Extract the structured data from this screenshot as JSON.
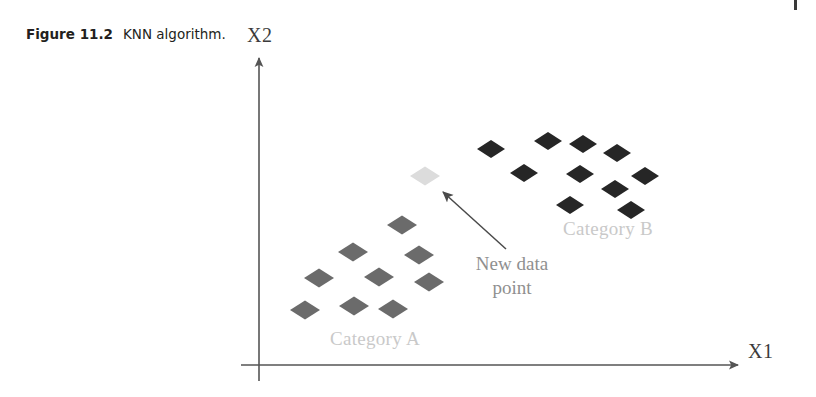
{
  "figure": {
    "caption_label": "Figure 11.2",
    "caption_text": "KNN algorithm."
  },
  "axes": {
    "y_label": "X2",
    "x_label": "X1",
    "axis_color": "#555555",
    "origin": {
      "x": 259,
      "y": 365
    },
    "y_top": 55,
    "x_right": 742,
    "x_left": 241,
    "y_bottom": 381
  },
  "annotations": {
    "category_a_label": "Category A",
    "category_b_label": "Category B",
    "new_point_label": "New data\npoint",
    "category_label_color": "#c9c9c9",
    "new_point_label_color": "#8f8f8f",
    "arrow": {
      "tail": {
        "x": 506,
        "y": 249
      },
      "head": {
        "x": 436,
        "y": 186
      },
      "color": "#4a4a4a"
    }
  },
  "chart_data": {
    "type": "scatter",
    "title": "KNN algorithm",
    "xlabel": "X1",
    "ylabel": "X2",
    "grid": false,
    "legend": "none",
    "marker": "diamond",
    "xlim": [
      259,
      742
    ],
    "ylim": [
      365,
      55
    ],
    "series": [
      {
        "name": "Category A",
        "color": "#6b6b6b",
        "marker_w": 30,
        "marker_h": 19,
        "points": [
          {
            "x": 402,
            "y": 225
          },
          {
            "x": 353,
            "y": 252
          },
          {
            "x": 419,
            "y": 255
          },
          {
            "x": 319,
            "y": 278
          },
          {
            "x": 379,
            "y": 277
          },
          {
            "x": 429,
            "y": 282
          },
          {
            "x": 305,
            "y": 310
          },
          {
            "x": 354,
            "y": 306
          },
          {
            "x": 393,
            "y": 309
          }
        ]
      },
      {
        "name": "Category B",
        "color": "#262626",
        "marker_w": 28,
        "marker_h": 18,
        "points": [
          {
            "x": 491,
            "y": 149
          },
          {
            "x": 548,
            "y": 141
          },
          {
            "x": 583,
            "y": 144
          },
          {
            "x": 617,
            "y": 153
          },
          {
            "x": 524,
            "y": 173
          },
          {
            "x": 580,
            "y": 174
          },
          {
            "x": 645,
            "y": 176
          },
          {
            "x": 615,
            "y": 189
          },
          {
            "x": 570,
            "y": 205
          },
          {
            "x": 631,
            "y": 210
          }
        ]
      },
      {
        "name": "New data point",
        "color": "#dcdcdc",
        "marker_w": 30,
        "marker_h": 19,
        "points": [
          {
            "x": 425,
            "y": 176
          }
        ]
      }
    ]
  }
}
